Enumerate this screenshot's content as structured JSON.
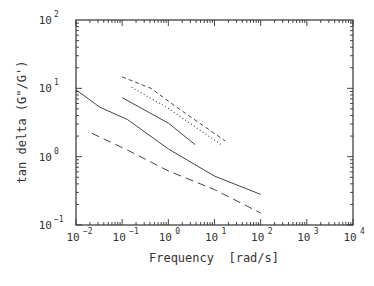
{
  "chart_data": {
    "type": "line",
    "title": "",
    "xlabel": "Frequency  [rad/s]",
    "ylabel": "tan delta (G\"/G')",
    "xscale": "log",
    "yscale": "log",
    "xlim": [
      0.01,
      10000
    ],
    "ylim": [
      0.1,
      100
    ],
    "x_ticks": [
      {
        "base": "10",
        "exp": "-2",
        "value": 0.01
      },
      {
        "base": "10",
        "exp": "-1",
        "value": 0.1
      },
      {
        "base": "10",
        "exp": "0",
        "value": 1
      },
      {
        "base": "10",
        "exp": "1",
        "value": 10
      },
      {
        "base": "10",
        "exp": "2",
        "value": 100
      },
      {
        "base": "10",
        "exp": "3",
        "value": 1000
      },
      {
        "base": "10",
        "exp": "4",
        "value": 10000
      }
    ],
    "y_ticks": [
      {
        "base": "10",
        "exp": "-1",
        "value": 0.1
      },
      {
        "base": "10",
        "exp": "0",
        "value": 1
      },
      {
        "base": "10",
        "exp": "1",
        "value": 10
      },
      {
        "base": "10",
        "exp": "2",
        "value": 100
      }
    ],
    "grid": false,
    "legend": null,
    "series": [
      {
        "name": "solid-long",
        "style": "solid",
        "x": [
          0.01,
          0.033,
          0.13,
          1,
          10,
          100
        ],
        "y": [
          9.5,
          5.3,
          3.5,
          1.3,
          0.52,
          0.28
        ]
      },
      {
        "name": "long-dash",
        "style": "longdash",
        "x": [
          0.022,
          0.13,
          1,
          10,
          100
        ],
        "y": [
          2.2,
          1.25,
          0.62,
          0.33,
          0.15
        ]
      },
      {
        "name": "solid-short",
        "style": "solid",
        "x": [
          0.1,
          1,
          3.8
        ],
        "y": [
          7.3,
          3.1,
          1.5
        ]
      },
      {
        "name": "dotted",
        "style": "dotted",
        "x": [
          0.16,
          1,
          15
        ],
        "y": [
          10.4,
          5.1,
          1.45
        ]
      },
      {
        "name": "short-dash",
        "style": "shortdash",
        "x": [
          0.1,
          0.42,
          1.45,
          17
        ],
        "y": [
          14.7,
          10,
          5.4,
          1.7
        ]
      }
    ]
  },
  "colors": {
    "axis": "#333333",
    "line": "#444444",
    "background": "#ffffff"
  }
}
